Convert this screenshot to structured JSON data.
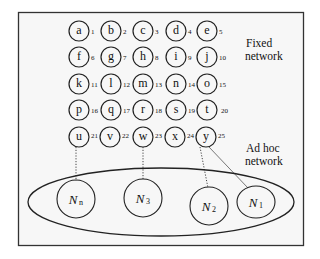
{
  "diagram": {
    "fixed_network_label": [
      "Fixed",
      "network"
    ],
    "adhoc_network_label": [
      "Ad hoc",
      "network"
    ],
    "fixed_nodes": [
      {
        "label": "a",
        "num": "1"
      },
      {
        "label": "b",
        "num": "2"
      },
      {
        "label": "c",
        "num": "3"
      },
      {
        "label": "d",
        "num": "4"
      },
      {
        "label": "e",
        "num": "5"
      },
      {
        "label": "f",
        "num": "6"
      },
      {
        "label": "g",
        "num": "7"
      },
      {
        "label": "h",
        "num": "8"
      },
      {
        "label": "i",
        "num": "9"
      },
      {
        "label": "j",
        "num": "10"
      },
      {
        "label": "k",
        "num": "11"
      },
      {
        "label": "l",
        "num": "12"
      },
      {
        "label": "m",
        "num": "13"
      },
      {
        "label": "n",
        "num": "14"
      },
      {
        "label": "o",
        "num": "15"
      },
      {
        "label": "p",
        "num": "16"
      },
      {
        "label": "q",
        "num": "17"
      },
      {
        "label": "r",
        "num": "18"
      },
      {
        "label": "s",
        "num": "19"
      },
      {
        "label": "t",
        "num": "20"
      },
      {
        "label": "u",
        "num": "21"
      },
      {
        "label": "v",
        "num": "22"
      },
      {
        "label": "w",
        "num": "23"
      },
      {
        "label": "x",
        "num": "24"
      },
      {
        "label": "y",
        "num": "25"
      }
    ],
    "mobile_nodes": [
      {
        "label": "N",
        "sub": "n"
      },
      {
        "label": "N",
        "sub": "3"
      },
      {
        "label": "N",
        "sub": "2"
      },
      {
        "label": "N",
        "sub": "1"
      }
    ],
    "links": [
      {
        "from": "u",
        "to": "N_n",
        "style": "dotted"
      },
      {
        "from": "w",
        "to": "N_3",
        "style": "dotted"
      },
      {
        "from": "y",
        "to": "N_2",
        "style": "dotted"
      },
      {
        "from": "y",
        "to": "N_1",
        "style": "solid"
      }
    ]
  }
}
